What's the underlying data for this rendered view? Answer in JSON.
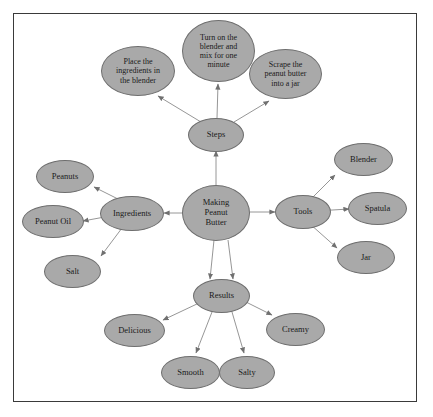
{
  "diagram": {
    "background_color": "#ffffff",
    "frame_color": "#3a3a3a",
    "node_fill": "#a9a9a9",
    "node_stroke": "#6e6e6e",
    "edge_color": "#8a8a8a",
    "text_color": "#1a1a1a",
    "center": {
      "id": "center",
      "label": "Making Peanut Butter",
      "lines": [
        "Making",
        "Peanut",
        "Butter"
      ]
    },
    "branches": [
      {
        "id": "steps",
        "label": "Steps",
        "children": [
          {
            "id": "step-place",
            "label": "Place the ingredients in the blender",
            "lines": [
              "Place the",
              "ingredients in",
              "the blender"
            ]
          },
          {
            "id": "step-blend",
            "label": "Turn on the blender and mix for one minute",
            "lines": [
              "Turn on the",
              "blender and",
              "mix for one",
              "minute"
            ]
          },
          {
            "id": "step-scrape",
            "label": "Scrape the peanut butter into a jar",
            "lines": [
              "Scrape the",
              "peanut butter",
              "into a jar"
            ]
          }
        ]
      },
      {
        "id": "ingredients",
        "label": "Ingredients",
        "children": [
          {
            "id": "ing-peanuts",
            "label": "Peanuts",
            "lines": [
              "Peanuts"
            ]
          },
          {
            "id": "ing-peanut-oil",
            "label": "Peanut Oil",
            "lines": [
              "Peanut Oil"
            ]
          },
          {
            "id": "ing-salt",
            "label": "Salt",
            "lines": [
              "Salt"
            ]
          }
        ]
      },
      {
        "id": "tools",
        "label": "Tools",
        "children": [
          {
            "id": "tool-blender",
            "label": "Blender",
            "lines": [
              "Blender"
            ]
          },
          {
            "id": "tool-spatula",
            "label": "Spatula",
            "lines": [
              "Spatula"
            ]
          },
          {
            "id": "tool-jar",
            "label": "Jar",
            "lines": [
              "Jar"
            ]
          }
        ]
      },
      {
        "id": "results",
        "label": "Results",
        "children": [
          {
            "id": "res-delicious",
            "label": "Delicious",
            "lines": [
              "Delicious"
            ]
          },
          {
            "id": "res-smooth",
            "label": "Smooth",
            "lines": [
              "Smooth"
            ]
          },
          {
            "id": "res-salty",
            "label": "Salty",
            "lines": [
              "Salty"
            ]
          },
          {
            "id": "res-creamy",
            "label": "Creamy",
            "lines": [
              "Creamy"
            ]
          }
        ]
      }
    ]
  }
}
